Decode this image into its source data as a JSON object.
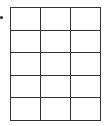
{
  "grid": {
    "rows": 5,
    "columns": 3,
    "cells": [
      [
        "",
        "",
        ""
      ],
      [
        "",
        "",
        ""
      ],
      [
        "",
        "",
        ""
      ],
      [
        "",
        "",
        ""
      ],
      [
        "",
        "",
        ""
      ]
    ],
    "line_color": "#333333"
  },
  "marker": {
    "icon": "bullet-dot-icon"
  }
}
